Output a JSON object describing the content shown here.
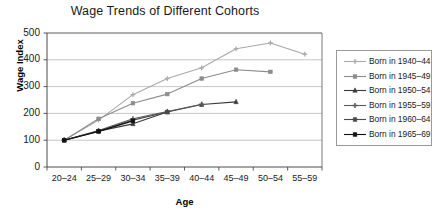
{
  "chart_data": {
    "type": "line",
    "title": "Wage Trends of Different Cohorts",
    "xlabel": "Age",
    "ylabel": "Wage Index",
    "categories": [
      "20–24",
      "25–29",
      "30–34",
      "35–39",
      "40–44",
      "45–49",
      "50–54",
      "55–59"
    ],
    "ylim": [
      0,
      500
    ],
    "yticks": [
      0,
      100,
      200,
      300,
      400,
      500
    ],
    "grid": "horizontal",
    "legend_position": "right",
    "series": [
      {
        "name": "Born in 1940–44",
        "color": "#a9a9a9",
        "marker": "plus",
        "values": [
          100,
          175,
          270,
          330,
          370,
          441,
          463,
          421
        ]
      },
      {
        "name": "Born in 1945–49",
        "color": "#8c8c8c",
        "marker": "square",
        "values": [
          100,
          180,
          238,
          272,
          330,
          363,
          355,
          null
        ]
      },
      {
        "name": "Born in 1950–54",
        "color": "#3a3a3a",
        "marker": "triangle",
        "values": [
          100,
          134,
          161,
          205,
          233,
          243,
          null,
          null
        ]
      },
      {
        "name": "Born in 1955–59",
        "color": "#5a5a5a",
        "marker": "cross",
        "values": [
          100,
          136,
          180,
          207,
          234,
          null,
          null,
          null
        ]
      },
      {
        "name": "Born in 1960–64",
        "color": "#4a4a4a",
        "marker": "square",
        "values": [
          100,
          133,
          175,
          205,
          null,
          null,
          null,
          null
        ]
      },
      {
        "name": "Born in 1965–69",
        "color": "#111111",
        "marker": "square",
        "values": [
          100,
          133,
          172,
          null,
          null,
          null,
          null,
          null
        ]
      }
    ]
  }
}
